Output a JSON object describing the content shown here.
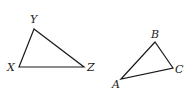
{
  "triangles": [
    {
      "name": "XYZ",
      "vertices": {
        "X": {
          "label": "X",
          "x": 19,
          "y": 67
        },
        "Y": {
          "label": "Y",
          "x": 34,
          "y": 29
        },
        "Z": {
          "label": "Z",
          "x": 84,
          "y": 67
        }
      }
    },
    {
      "name": "ABC",
      "vertices": {
        "A": {
          "label": "A",
          "x": 121,
          "y": 79
        },
        "B": {
          "label": "B",
          "x": 155,
          "y": 42
        },
        "C": {
          "label": "C",
          "x": 173,
          "y": 68
        }
      }
    }
  ],
  "labels": {
    "X": "X",
    "Y": "Y",
    "Z": "Z",
    "A": "A",
    "B": "B",
    "C": "C"
  },
  "colors": {
    "stroke": "#1a1a1a",
    "background": "#ffffff"
  }
}
